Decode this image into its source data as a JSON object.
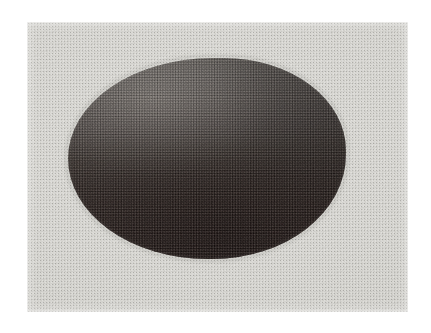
{
  "page": {
    "background_color": "#ffffff",
    "width": 431,
    "height": 333
  },
  "photo_plate": {
    "name": "scanned halftone photograph",
    "x": 27,
    "y": 22,
    "width": 381,
    "height": 290,
    "background_color": "#d9d9d4",
    "print_process": "halftone-screen",
    "border": "none"
  },
  "subject": {
    "label": "dark rounded object",
    "shape": "egg-shaped blob",
    "x": 68,
    "y": 58,
    "width": 278,
    "height": 201,
    "highlight_color": "#5e5a56",
    "midtone_color": "#4a4442",
    "shadow_color": "#2a1f1e",
    "lighting": "diffuse light from upper-left",
    "gradient_direction": "top-light to bottom-dark"
  },
  "caption": {
    "text": ""
  }
}
